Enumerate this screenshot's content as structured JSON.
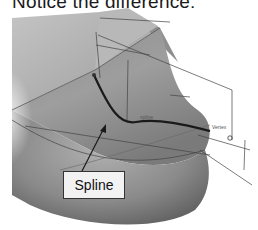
{
  "heading": {
    "text": "Notice the difference:"
  },
  "diagram": {
    "callout_label": "Spline",
    "annotations": {
      "spline_label": "spline",
      "dim_top_1": "d1",
      "dim_top_2": "d2",
      "vertex_label_right": "Vertex",
      "vertex_label_left": "Vertex"
    },
    "colors": {
      "surface_dark": "#707070",
      "surface_mid": "#9a9a9a",
      "surface_light": "#c8c8c8",
      "spline_curve": "#1a1a1a",
      "dimension_lines": "#444444"
    }
  }
}
